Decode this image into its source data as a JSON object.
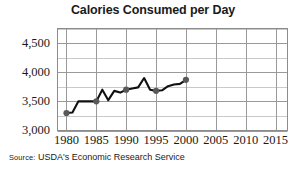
{
  "chart_data": {
    "type": "line",
    "title": "Calories Consumed per Day",
    "xlabel": "",
    "ylabel": "",
    "xlim": [
      1978.5,
      2017
    ],
    "ylim": [
      3000,
      4750
    ],
    "grid": true,
    "legend": "none",
    "marker_color": "#595959",
    "line_color": "#111111",
    "gridline_color": "#9a9a9a",
    "minor_gridline_color": "#c9c9c9",
    "x_ticks": [
      1980,
      1985,
      1990,
      1995,
      2000,
      2005,
      2010,
      2015
    ],
    "x_tick_labels": [
      "1980",
      "1985",
      "1990",
      "1995",
      "2000",
      "2005",
      "2010",
      "2015"
    ],
    "y_ticks": [
      3000,
      3500,
      4000,
      4500
    ],
    "y_tick_labels": [
      "3,000",
      "3,500",
      "4,000",
      "4,500"
    ],
    "y_minor_ticks": [
      3250,
      3750,
      4250,
      4750
    ],
    "x": [
      1980,
      1981,
      1982,
      1983,
      1984,
      1985,
      1986,
      1987,
      1988,
      1989,
      1990,
      1991,
      1992,
      1993,
      1994,
      1995,
      1996,
      1997,
      1998,
      1999,
      2000
    ],
    "values": [
      3300,
      3310,
      3500,
      3500,
      3500,
      3500,
      3700,
      3520,
      3680,
      3650,
      3700,
      3720,
      3740,
      3900,
      3700,
      3680,
      3690,
      3760,
      3790,
      3800,
      3870
    ],
    "marker_x": [
      1980,
      1985,
      1990,
      1995,
      2000
    ],
    "marker_values": [
      3300,
      3500,
      3700,
      3680,
      3870
    ],
    "annotations": []
  },
  "source": {
    "label": "Source:",
    "text": "USDA's Economic Research Service"
  }
}
